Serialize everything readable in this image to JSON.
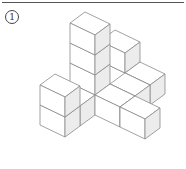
{
  "problem": {
    "label": "1"
  },
  "colors": {
    "top": "#ffffff",
    "left": "#ffffff",
    "right": "#ececec",
    "edge": "#8a8a8a"
  },
  "projection": {
    "origin": [
      70,
      103
    ],
    "a": [
      25,
      12
    ],
    "b": [
      15,
      -11
    ],
    "c": [
      0,
      -20
    ]
  },
  "cubes": [
    {
      "x": 0,
      "y": 0,
      "z": 0
    },
    {
      "x": 0,
      "y": 0,
      "z": 1
    },
    {
      "x": 0,
      "y": 0,
      "z": 2
    },
    {
      "x": 0,
      "y": 0,
      "z": 3
    },
    {
      "x": -2,
      "y": 0,
      "z": 0
    },
    {
      "x": -2,
      "y": 0,
      "z": 1
    },
    {
      "x": -1,
      "y": 0,
      "z": 0
    },
    {
      "x": 0,
      "y": 1,
      "z": 0
    },
    {
      "x": 0,
      "y": 2,
      "z": 0
    },
    {
      "x": 1,
      "y": 1,
      "z": 0
    },
    {
      "x": 2,
      "y": 0,
      "z": 0
    },
    {
      "x": 2,
      "y": 0,
      "z": 1
    },
    {
      "x": 2,
      "y": 1,
      "z": 0
    }
  ]
}
